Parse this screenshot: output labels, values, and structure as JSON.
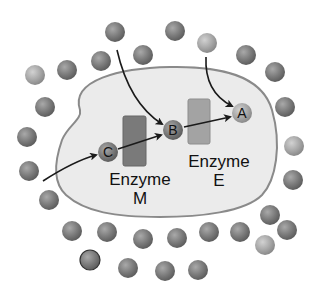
{
  "diagram": {
    "colors": {
      "background": "#ffffff",
      "cell_fill": "#ebebeb",
      "cell_border": "#8a8a8a",
      "molecule": "#7d7d7d",
      "molecule_light": "#a8a8a8",
      "enzyme_m": "#7a7a7a",
      "enzyme_e": "#a3a3a3",
      "arrow": "#1a1a1a"
    },
    "molecules": {
      "C": {
        "label": "C",
        "x": 108,
        "y": 152
      },
      "B": {
        "label": "B",
        "x": 173,
        "y": 130
      },
      "A": {
        "label": "A",
        "x": 242,
        "y": 113
      }
    },
    "enzymes": [
      {
        "id": "enzyme-m",
        "label_line1": "Enzyme",
        "label_line2": "M"
      },
      {
        "id": "enzyme-e",
        "label_line1": "Enzyme",
        "label_line2": "E"
      }
    ],
    "outside_molecules": [
      [
        115,
        32,
        "d"
      ],
      [
        175,
        31,
        "d"
      ],
      [
        207,
        43,
        "l"
      ],
      [
        143,
        55,
        "d"
      ],
      [
        101,
        61,
        "d"
      ],
      [
        246,
        55,
        "d"
      ],
      [
        275,
        72,
        "d"
      ],
      [
        35,
        75,
        "l"
      ],
      [
        67,
        70,
        "d"
      ],
      [
        45,
        107,
        "d"
      ],
      [
        285,
        107,
        "d"
      ],
      [
        27,
        137,
        "d"
      ],
      [
        294,
        146,
        "l"
      ],
      [
        293,
        180,
        "d"
      ],
      [
        29,
        171,
        "d"
      ],
      [
        49,
        200,
        "d"
      ],
      [
        270,
        215,
        "d"
      ],
      [
        72,
        231,
        "d"
      ],
      [
        107,
        232,
        "d"
      ],
      [
        143,
        239,
        "d"
      ],
      [
        177,
        238,
        "d"
      ],
      [
        209,
        232,
        "d"
      ],
      [
        240,
        232,
        "d"
      ],
      [
        287,
        230,
        "d"
      ],
      [
        265,
        245,
        "l"
      ],
      [
        90,
        260,
        "o"
      ],
      [
        128,
        268,
        "d"
      ],
      [
        165,
        271,
        "d"
      ],
      [
        198,
        270,
        "d"
      ]
    ]
  }
}
